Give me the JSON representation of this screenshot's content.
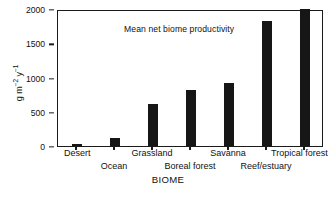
{
  "chart_data": {
    "type": "bar",
    "title": "",
    "annotation": "Mean net biome productivity",
    "xlabel": "BIOME",
    "ylabel": "g m-2 y-1",
    "ylabel_parts": {
      "unit": "g m",
      "sup1": "−2",
      "mid": " y",
      "sup2": "−1"
    },
    "categories": [
      "Desert",
      "Ocean",
      "Grassland",
      "Boreal forest",
      "Savanna",
      "Reef/estuary",
      "Tropical forest"
    ],
    "values": [
      30,
      120,
      610,
      820,
      920,
      1820,
      2050
    ],
    "value_note": "Tropical forest bar is clipped at the top of the axis",
    "ylim": [
      0,
      2000
    ],
    "yticks": [
      0,
      500,
      1000,
      1500,
      2000
    ],
    "ytick_labels": [
      "0",
      "500",
      "1000",
      "1500",
      "2000"
    ],
    "grid": false,
    "legend": null,
    "bar_color": "#161616",
    "axis_color": "#1a1a1a",
    "label_rows": [
      0,
      1,
      0,
      1,
      0,
      1,
      0
    ]
  }
}
